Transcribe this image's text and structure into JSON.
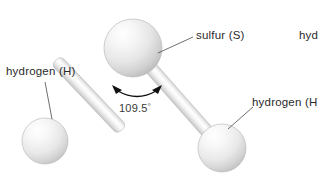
{
  "diagram": {
    "background_color": "#ffffff",
    "text_color": "#2b2b2b",
    "atoms": [
      {
        "id": "sulfur",
        "label": "sulfur (S)",
        "element": "S",
        "cx": 133,
        "cy": 48,
        "r": 29,
        "highlight_color": "#fdfdfd",
        "mid_color": "#ececec",
        "edge_color": "#c4c4c4"
      },
      {
        "id": "hydrogen-left",
        "label": "hydrogen (H)",
        "element": "H",
        "cx": 45,
        "cy": 141,
        "r": 23,
        "highlight_color": "#fdfdfd",
        "mid_color": "#ededed",
        "edge_color": "#c8c8c8"
      },
      {
        "id": "hydrogen-right",
        "label": "hydrogen (H)",
        "element": "H",
        "cx": 222,
        "cy": 148,
        "r": 24,
        "highlight_color": "#fdfdfd",
        "mid_color": "#ededed",
        "edge_color": "#c8c8c8"
      }
    ],
    "bonds": [
      {
        "id": "bond-sulfur-hydrogen-left",
        "from": "sulfur",
        "to": "hydrogen-left",
        "width": 13
      },
      {
        "id": "bond-sulfur-hydrogen-right",
        "from": "sulfur",
        "to": "hydrogen-right",
        "width": 13
      }
    ],
    "bond_angle": {
      "value": "109.5",
      "unit": "°",
      "text": "109.5°",
      "arc_color": "#111111"
    },
    "clipped_label": {
      "text": "hyd",
      "note": "hydrogen label cut off at right edge of image"
    },
    "leader_lines": [
      {
        "id": "leader-sulfur",
        "x1": 158,
        "y1": 53,
        "x2": 193,
        "y2": 37
      },
      {
        "id": "leader-hydrogen-left",
        "x1": 45,
        "y1": 82,
        "x2": 52,
        "y2": 119
      },
      {
        "id": "leader-hydrogen-right",
        "x1": 228,
        "y1": 129,
        "x2": 253,
        "y2": 107
      }
    ]
  }
}
